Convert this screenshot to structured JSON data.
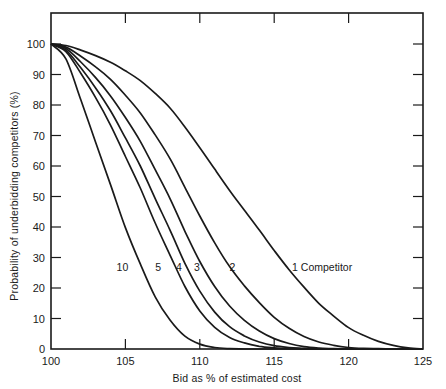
{
  "chart_data": {
    "type": "line",
    "title": "",
    "xlabel": "Bid as % of estimated cost",
    "ylabel": "Probability of underbidding competitors (%)",
    "xlim": [
      100,
      125
    ],
    "ylim": [
      0,
      100
    ],
    "x_ticks": [
      100,
      105,
      110,
      115,
      120,
      125
    ],
    "y_ticks": [
      0,
      10,
      20,
      30,
      40,
      50,
      60,
      70,
      80,
      90,
      100
    ],
    "grid": false,
    "legend": "inline curve labels",
    "x": [
      100,
      101,
      102,
      103,
      104,
      105,
      106,
      107,
      108,
      109,
      110,
      111,
      112,
      113,
      114,
      115,
      116,
      117,
      118,
      119,
      120,
      121,
      122,
      123,
      124,
      125
    ],
    "series": [
      {
        "name": "1 Competitor",
        "label": "1 Competitor",
        "values": [
          100,
          99.5,
          98,
          96.2,
          94,
          91.2,
          88,
          83.8,
          79,
          72.8,
          66,
          59,
          52,
          45.5,
          39,
          32.3,
          26,
          20.3,
          15,
          10.8,
          7,
          4.5,
          2.5,
          1.2,
          0.4,
          0
        ]
      },
      {
        "name": "2",
        "label": "2",
        "values": [
          100,
          99,
          96,
          92.5,
          88.4,
          83.2,
          77.4,
          70.2,
          62.4,
          53,
          43.6,
          34.8,
          27,
          20.7,
          15.2,
          10.4,
          6.8,
          4.1,
          2.3,
          1.2,
          0.5,
          0.2,
          0.1,
          0,
          0,
          0
        ]
      },
      {
        "name": "3",
        "label": "3",
        "values": [
          100,
          98.5,
          94.1,
          89,
          83,
          75.9,
          68.1,
          58.8,
          49.3,
          38.6,
          28.7,
          20.5,
          14.1,
          9.4,
          5.9,
          3.4,
          1.8,
          0.8,
          0.3,
          0.1,
          0,
          0,
          0,
          0,
          0,
          0
        ]
      },
      {
        "name": "4",
        "label": "4",
        "values": [
          100,
          98,
          92.2,
          85.6,
          78.1,
          69.2,
          60,
          49.3,
          39,
          28.1,
          19,
          12.1,
          7.3,
          4.3,
          2.3,
          1.1,
          0.5,
          0.2,
          0,
          0,
          0,
          0,
          0,
          0,
          0,
          0
        ]
      },
      {
        "name": "5",
        "label": "5",
        "values": [
          100,
          97.5,
          90.4,
          82.4,
          73.4,
          63.1,
          52.8,
          41.3,
          30.8,
          20.5,
          12.5,
          7.1,
          3.8,
          2,
          0.9,
          0.4,
          0.1,
          0,
          0,
          0,
          0,
          0,
          0,
          0,
          0,
          0
        ]
      },
      {
        "name": "10",
        "label": "10",
        "values": [
          100,
          95.1,
          81.7,
          67.8,
          53.9,
          39.8,
          27.9,
          17.1,
          9.5,
          4.2,
          1.6,
          0.5,
          0.1,
          0,
          0,
          0,
          0,
          0,
          0,
          0,
          0,
          0,
          0,
          0,
          0,
          0
        ]
      }
    ],
    "annotations": [
      {
        "text": "10",
        "x": 104.8,
        "y": 27
      },
      {
        "text": "5",
        "x": 107.2,
        "y": 27
      },
      {
        "text": "4",
        "x": 108.6,
        "y": 27
      },
      {
        "text": "3",
        "x": 109.8,
        "y": 27
      },
      {
        "text": "2",
        "x": 112.2,
        "y": 27
      },
      {
        "text": "1 Competitor",
        "x": 116.2,
        "y": 27
      }
    ]
  }
}
